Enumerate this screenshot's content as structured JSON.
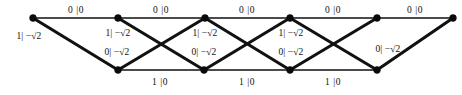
{
  "diagram": {
    "kind": "trellis-diagram",
    "width": 462,
    "height": 95,
    "background_color": "#ffffff",
    "line_color": "#111111",
    "node_color": "#0a0a0a",
    "top_row_y": 18,
    "bottom_row_y": 70,
    "top_nodes_x": [
      33,
      118,
      205,
      290,
      377,
      453
    ],
    "bottom_nodes_x": [
      118,
      204,
      290,
      377
    ],
    "labels": {
      "top_edge": "0 |0",
      "bottom_edge": "1 |0",
      "descending_edge": "1| −√2",
      "ascending_edge": "0| −√2"
    },
    "edges": [
      {
        "id": "t0",
        "type": "horizontal-top",
        "from": "top-0",
        "to": "top-1",
        "label": "0 |0"
      },
      {
        "id": "t1",
        "type": "horizontal-top",
        "from": "top-1",
        "to": "top-2",
        "label": "0 |0"
      },
      {
        "id": "t2",
        "type": "horizontal-top",
        "from": "top-2",
        "to": "top-3",
        "label": "0 |0"
      },
      {
        "id": "t3",
        "type": "horizontal-top",
        "from": "top-3",
        "to": "top-4",
        "label": "0 |0"
      },
      {
        "id": "t4",
        "type": "horizontal-top",
        "from": "top-4",
        "to": "top-5",
        "label": "0 |0"
      },
      {
        "id": "b0",
        "type": "horizontal-bottom",
        "from": "bottom-0",
        "to": "bottom-1",
        "label": "1 |0"
      },
      {
        "id": "b1",
        "type": "horizontal-bottom",
        "from": "bottom-1",
        "to": "bottom-2",
        "label": "1 |0"
      },
      {
        "id": "b2",
        "type": "horizontal-bottom",
        "from": "bottom-2",
        "to": "bottom-3",
        "label": "1 |0"
      },
      {
        "id": "d0",
        "type": "descending",
        "from": "top-0",
        "to": "bottom-0",
        "label": "1| −√2"
      },
      {
        "id": "d1",
        "type": "descending",
        "from": "top-1",
        "to": "bottom-1",
        "label": "1| −√2"
      },
      {
        "id": "d2",
        "type": "descending",
        "from": "top-2",
        "to": "bottom-2",
        "label": "1| −√2"
      },
      {
        "id": "d3",
        "type": "descending",
        "from": "top-3",
        "to": "bottom-3",
        "label": "1| −√2"
      },
      {
        "id": "a0",
        "type": "ascending",
        "from": "bottom-0",
        "to": "top-2",
        "label": "0| −√2"
      },
      {
        "id": "a1",
        "type": "ascending",
        "from": "bottom-1",
        "to": "top-3",
        "label": "0| −√2"
      },
      {
        "id": "a2",
        "type": "ascending",
        "from": "bottom-2",
        "to": "top-4",
        "label": "0| −√2"
      },
      {
        "id": "a3",
        "type": "ascending",
        "from": "bottom-3",
        "to": "top-5",
        "label": "0| −√2"
      }
    ],
    "label_positions": {
      "top": [
        {
          "x": 76,
          "y": 11,
          "text": "0 |0"
        },
        {
          "x": 161,
          "y": 11,
          "text": "0 |0"
        },
        {
          "x": 247,
          "y": 11,
          "text": "0 |0"
        },
        {
          "x": 333,
          "y": 11,
          "text": "0 |0"
        },
        {
          "x": 415,
          "y": 11,
          "text": "0 |0"
        }
      ],
      "bottom": [
        {
          "x": 160,
          "y": 83,
          "text": "1 |0"
        },
        {
          "x": 247,
          "y": 83,
          "text": "1 |0"
        },
        {
          "x": 333,
          "y": 83,
          "text": "1 |0"
        }
      ],
      "descending": [
        {
          "x": 29,
          "y": 37,
          "text": "1| −√2"
        },
        {
          "x": 118,
          "y": 34,
          "text": "1| −√2"
        },
        {
          "x": 205,
          "y": 34,
          "text": "1| −√2"
        },
        {
          "x": 291,
          "y": 34,
          "text": "1| −√2"
        }
      ],
      "ascending": [
        {
          "x": 117,
          "y": 53,
          "text": "0| −√2"
        },
        {
          "x": 204,
          "y": 53,
          "text": "0| −√2"
        },
        {
          "x": 291,
          "y": 53,
          "text": "0| −√2"
        },
        {
          "x": 388,
          "y": 50,
          "text": "0| −√2"
        }
      ]
    }
  }
}
